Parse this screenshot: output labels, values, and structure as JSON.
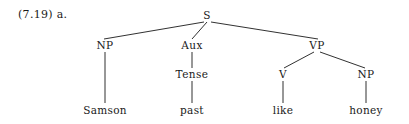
{
  "example_label": "(7.19) a.",
  "figure": {
    "type": "syntax-tree",
    "sentence": "Samson past like honey",
    "ink_color": "#1a1a1a",
    "background_color": "#ffffff"
  },
  "nodes": [
    {
      "id": "S",
      "label": "S",
      "x": 207,
      "y": 15,
      "kind": "category"
    },
    {
      "id": "NP1",
      "label": "NP",
      "x": 105,
      "y": 45,
      "kind": "category"
    },
    {
      "id": "Aux",
      "label": "Aux",
      "x": 192,
      "y": 45,
      "kind": "category"
    },
    {
      "id": "VP",
      "label": "VP",
      "x": 317,
      "y": 45,
      "kind": "category"
    },
    {
      "id": "Tense",
      "label": "Tense",
      "x": 192,
      "y": 74,
      "kind": "category"
    },
    {
      "id": "V",
      "label": "V",
      "x": 283,
      "y": 74,
      "kind": "category"
    },
    {
      "id": "NP2",
      "label": "NP",
      "x": 366,
      "y": 74,
      "kind": "category"
    },
    {
      "id": "Samson",
      "label": "Samson",
      "x": 105,
      "y": 110,
      "kind": "terminal"
    },
    {
      "id": "past",
      "label": "past",
      "x": 192,
      "y": 110,
      "kind": "terminal"
    },
    {
      "id": "like",
      "label": "like",
      "x": 283,
      "y": 110,
      "kind": "terminal"
    },
    {
      "id": "honey",
      "label": "honey",
      "x": 366,
      "y": 110,
      "kind": "terminal"
    }
  ],
  "edges": [
    {
      "from": "S",
      "to": "NP1",
      "x1": 204,
      "y1": 22,
      "x2": 104,
      "y2": 39
    },
    {
      "from": "S",
      "to": "Aux",
      "x1": 207,
      "y1": 22,
      "x2": 192,
      "y2": 39
    },
    {
      "from": "S",
      "to": "VP",
      "x1": 211,
      "y1": 22,
      "x2": 318,
      "y2": 39
    },
    {
      "from": "NP1",
      "to": "Samson",
      "x1": 105,
      "y1": 52,
      "x2": 105,
      "y2": 103
    },
    {
      "from": "Aux",
      "to": "Tense",
      "x1": 192,
      "y1": 52,
      "x2": 192,
      "y2": 68
    },
    {
      "from": "Tense",
      "to": "past",
      "x1": 192,
      "y1": 81,
      "x2": 192,
      "y2": 103
    },
    {
      "from": "VP",
      "to": "V",
      "x1": 314,
      "y1": 52,
      "x2": 284,
      "y2": 68
    },
    {
      "from": "VP",
      "to": "NP2",
      "x1": 320,
      "y1": 52,
      "x2": 365,
      "y2": 68
    },
    {
      "from": "V",
      "to": "like",
      "x1": 283,
      "y1": 81,
      "x2": 283,
      "y2": 103
    },
    {
      "from": "NP2",
      "to": "honey",
      "x1": 366,
      "y1": 81,
      "x2": 366,
      "y2": 103
    }
  ]
}
